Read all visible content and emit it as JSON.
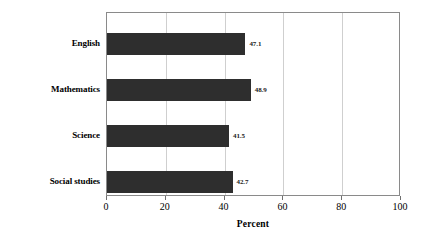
{
  "chart_data": {
    "type": "bar",
    "orientation": "horizontal",
    "title": "",
    "subtitle": "",
    "categories": [
      "English",
      "Mathematics",
      "Science",
      "Social studies"
    ],
    "values": [
      47.1,
      48.9,
      41.5,
      42.7
    ],
    "value_labels": [
      "47.1",
      "48.9",
      "41.5",
      "42.7"
    ],
    "xlabel": "Percent",
    "ylabel": "",
    "xlim": [
      0,
      100
    ],
    "xticks": [
      0,
      20,
      40,
      60,
      80,
      100
    ],
    "xtick_labels": [
      "0",
      "20",
      "40",
      "60",
      "80",
      "100"
    ],
    "grid": true,
    "grid_axis": "x",
    "legend": null,
    "annotations": [],
    "colors": {
      "bar": "#2e2e2e",
      "background": "#ffffff",
      "gridline": "#cfcfcf",
      "axis": "#8a8a8a",
      "text": "#000000"
    }
  }
}
